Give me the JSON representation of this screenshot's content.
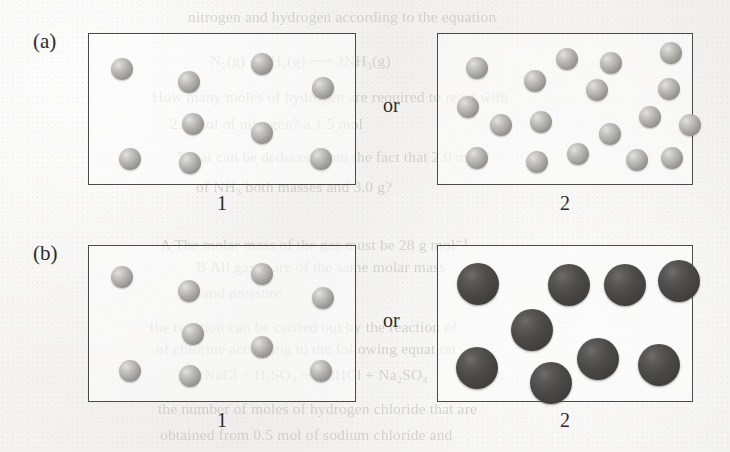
{
  "figure": {
    "background_color": "#f3f2f0",
    "box_border_color": "#4a4a4a",
    "light_sphere_color": "#aeadaa",
    "dark_sphere_color": "#4c4b4a",
    "rows": [
      {
        "id": "row-a",
        "label": "(a)",
        "label_x": 33,
        "label_y": 31,
        "connector": "or",
        "connector_x": 383,
        "connector_y": 95,
        "panels": [
          {
            "id": "panel-a-1",
            "number": "1",
            "box": {
              "x": 88,
              "y": 33,
              "w": 268,
              "h": 152
            },
            "number_y": 193,
            "sphere_type": "light",
            "sphere_count": 9,
            "sphere_diameter": 22,
            "spheres": [
              {
                "cx": 122,
                "cy": 69
              },
              {
                "cx": 189,
                "cy": 82
              },
              {
                "cx": 262,
                "cy": 64
              },
              {
                "cx": 323,
                "cy": 88
              },
              {
                "cx": 193,
                "cy": 124
              },
              {
                "cx": 262,
                "cy": 133
              },
              {
                "cx": 130,
                "cy": 159
              },
              {
                "cx": 190,
                "cy": 163
              },
              {
                "cx": 321,
                "cy": 159
              }
            ]
          },
          {
            "id": "panel-a-2",
            "number": "2",
            "box": {
              "x": 437,
              "y": 33,
              "w": 256,
              "h": 152
            },
            "number_y": 193,
            "sphere_type": "light",
            "sphere_count": 18,
            "sphere_diameter": 22,
            "spheres": [
              {
                "cx": 477,
                "cy": 68
              },
              {
                "cx": 535,
                "cy": 81
              },
              {
                "cx": 567,
                "cy": 59
              },
              {
                "cx": 611,
                "cy": 63
              },
              {
                "cx": 671,
                "cy": 53
              },
              {
                "cx": 468,
                "cy": 107
              },
              {
                "cx": 597,
                "cy": 90
              },
              {
                "cx": 669,
                "cy": 89
              },
              {
                "cx": 501,
                "cy": 125
              },
              {
                "cx": 541,
                "cy": 122
              },
              {
                "cx": 650,
                "cy": 117
              },
              {
                "cx": 610,
                "cy": 134
              },
              {
                "cx": 690,
                "cy": 125
              },
              {
                "cx": 477,
                "cy": 158
              },
              {
                "cx": 537,
                "cy": 162
              },
              {
                "cx": 578,
                "cy": 154
              },
              {
                "cx": 637,
                "cy": 160
              },
              {
                "cx": 672,
                "cy": 158
              }
            ]
          }
        ]
      },
      {
        "id": "row-b",
        "label": "(b)",
        "label_x": 33,
        "label_y": 243,
        "connector": "or",
        "connector_x": 383,
        "connector_y": 310,
        "panels": [
          {
            "id": "panel-b-1",
            "number": "1",
            "box": {
              "x": 88,
              "y": 245,
              "w": 268,
              "h": 157
            },
            "number_y": 410,
            "sphere_type": "light",
            "sphere_count": 9,
            "sphere_diameter": 22,
            "spheres": [
              {
                "cx": 122,
                "cy": 277
              },
              {
                "cx": 189,
                "cy": 291
              },
              {
                "cx": 262,
                "cy": 274
              },
              {
                "cx": 323,
                "cy": 298
              },
              {
                "cx": 193,
                "cy": 334
              },
              {
                "cx": 262,
                "cy": 347
              },
              {
                "cx": 130,
                "cy": 371
              },
              {
                "cx": 190,
                "cy": 376
              },
              {
                "cx": 321,
                "cy": 371
              }
            ]
          },
          {
            "id": "panel-b-2",
            "number": "2",
            "box": {
              "x": 437,
              "y": 245,
              "w": 256,
              "h": 157
            },
            "number_y": 410,
            "sphere_type": "dark",
            "sphere_count": 8,
            "sphere_diameter": 42,
            "spheres": [
              {
                "cx": 478,
                "cy": 284
              },
              {
                "cx": 569,
                "cy": 285
              },
              {
                "cx": 625,
                "cy": 285
              },
              {
                "cx": 679,
                "cy": 281
              },
              {
                "cx": 532,
                "cy": 330
              },
              {
                "cx": 477,
                "cy": 368
              },
              {
                "cx": 551,
                "cy": 383
              },
              {
                "cx": 598,
                "cy": 359
              },
              {
                "cx": 659,
                "cy": 365
              }
            ]
          }
        ]
      }
    ]
  },
  "bleed_text": {
    "note": "faint reverse-side printing showing through the paper",
    "lines": [
      {
        "text": "nitrogen and hydrogen according to the equation",
        "x": 188,
        "y": 8
      },
      {
        "text": "N₂(g) + 3H₂(g) ⟶ 2NH₃(g)",
        "x": 210,
        "y": 52
      },
      {
        "text": "How many moles of hydrogen are required to react with",
        "x": 152,
        "y": 88
      },
      {
        "text": "2.0 mol of nitrogen? a 1.5 mol",
        "x": 170,
        "y": 115
      },
      {
        "text": "What can be deduced from the fact that 2.0 mol",
        "x": 178,
        "y": 148
      },
      {
        "text": "of NH₃ both masses and 3.0 g?",
        "x": 196,
        "y": 178
      },
      {
        "text": "A  The molar mass of the gas must be 28 g mol⁻¹",
        "x": 160,
        "y": 236
      },
      {
        "text": "B  All gases are of the same molar mass",
        "x": 196,
        "y": 258
      },
      {
        "text": "and pressure",
        "x": 202,
        "y": 284
      },
      {
        "text": "the reaction can be carried out by the reaction of",
        "x": 150,
        "y": 318
      },
      {
        "text": "of chlorine according to the following equation",
        "x": 156,
        "y": 340
      },
      {
        "text": "2NaCl + H₂SO₄ ⟶ 2HCl + Na₂SO₄",
        "x": 196,
        "y": 366
      },
      {
        "text": "the number of moles of hydrogen chloride that are",
        "x": 158,
        "y": 400
      },
      {
        "text": "obtained from 0.5 mol of sodium chloride and",
        "x": 160,
        "y": 426
      }
    ]
  }
}
